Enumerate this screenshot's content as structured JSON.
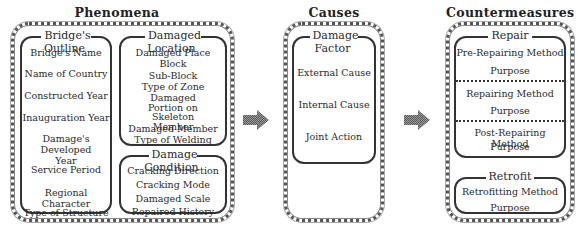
{
  "phenomena": {
    "title": "Phenomena",
    "bridges_outline": {
      "label": "Bridge's Outline",
      "items": [
        "Bridge's Name",
        "Name of Country",
        "Constructed Year",
        "Inauguration Year",
        "Damage's Developed Year",
        "Service Period",
        "Regional Character",
        "Type of Structure"
      ]
    },
    "damaged_location": {
      "label": "Damaged Location",
      "items": [
        "Damaged Place",
        "Block",
        "Sub-Block",
        "Type of Zone",
        "Damaged Portion on Skeleton Member",
        "Damaged Member",
        "Type of Welding"
      ]
    },
    "damage_condition": {
      "label": "Damage Condition",
      "items": [
        "Cracking Direction",
        "Cracking Mode",
        "Damaged Scale",
        "Repaired History"
      ]
    }
  },
  "causes": {
    "title": "Causes",
    "damage_factor": {
      "label": "Damage Factor",
      "items": [
        "External Cause",
        "Internal Cause",
        "Joint Action"
      ]
    }
  },
  "countermeasures": {
    "title": "Countermeasures",
    "repair": {
      "label": "Repair",
      "sections": [
        {
          "method": "Pre-Repairing Method",
          "purpose": "Purpose"
        },
        {
          "method": "Repairing Method",
          "purpose": "Purpose"
        },
        {
          "method": "Post-Repairing Method",
          "purpose": "Purpose"
        }
      ]
    },
    "retrofit": {
      "label": "Retrofit",
      "method": "Retrofitting Method",
      "purpose": "Purpose"
    }
  },
  "arrows": [
    "phenomena-to-causes",
    "causes-to-countermeasures"
  ]
}
